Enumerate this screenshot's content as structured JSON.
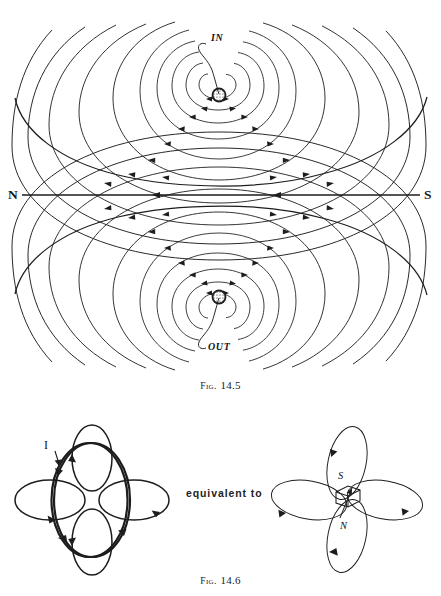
{
  "page": {
    "width": 441,
    "height": 596,
    "background": "#ffffff",
    "ink": "#1d1d1d"
  },
  "figures": [
    {
      "id": "fig-14-5",
      "caption_prefix": "Fig.",
      "caption_number": "14.5",
      "description": "Magnetic field lines around a current-carrying wire superposed on a uniform field",
      "labels": {
        "current_in": "IN",
        "current_out": "OUT",
        "pole_north": "N",
        "pole_south": "S"
      },
      "axis": {
        "y": 195,
        "x_start": 22,
        "x_end": 420,
        "arrow_direction": "left",
        "arrow_positions": [
          155,
          276
        ]
      },
      "top_wire": {
        "cx": 219,
        "cy": 95,
        "r": 7
      },
      "bottom_wire": {
        "cx": 219,
        "cy": 297,
        "r": 7
      },
      "arc_count": 11
    },
    {
      "id": "fig-14-6",
      "caption_prefix": "Fig.",
      "caption_number": "14.6",
      "description": "A current loop is equivalent to a small bar magnet",
      "connector_text": "equivalent to",
      "left_diagram": {
        "name": "current-loop",
        "current_label": "I",
        "loop_center_x": 92,
        "loop_center_y": 492,
        "field_loops": 4
      },
      "right_diagram": {
        "name": "bar-magnet",
        "pole_top": "S",
        "pole_bottom": "N",
        "magnet_center_x": 347,
        "magnet_center_y": 493,
        "field_loops": 4
      }
    }
  ]
}
